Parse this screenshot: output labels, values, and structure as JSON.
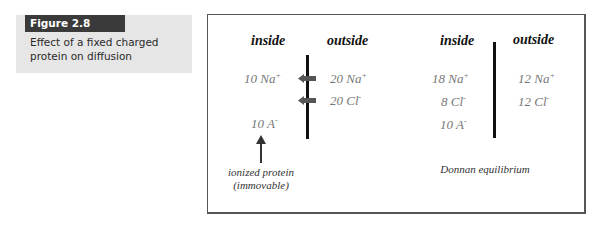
{
  "caption": {
    "label": "Figure 2.8",
    "text": "Effect of a fixed charged protein on diffusion"
  },
  "left_panel": {
    "inside_header": "inside",
    "outside_header": "outside",
    "inside_ions": [
      {
        "count": "10",
        "ion": "Na",
        "charge": "+"
      },
      {
        "count": "10",
        "ion": "A",
        "charge": "-"
      }
    ],
    "outside_ions": [
      {
        "count": "20",
        "ion": "Na",
        "charge": "+"
      },
      {
        "count": "20",
        "ion": "Cl",
        "charge": "-"
      }
    ],
    "annotation_line1": "ionized protein",
    "annotation_line2": "(immovable)"
  },
  "right_panel": {
    "inside_header": "inside",
    "outside_header": "outside",
    "inside_ions": [
      {
        "count": "18",
        "ion": "Na",
        "charge": "+"
      },
      {
        "count": "8",
        "ion": "Cl",
        "charge": "-"
      },
      {
        "count": "10",
        "ion": "A",
        "charge": "-"
      }
    ],
    "outside_ions": [
      {
        "count": "12",
        "ion": "Na",
        "charge": "+"
      },
      {
        "count": "12",
        "ion": "Cl",
        "charge": "-"
      }
    ],
    "label": "Donnan equilibrium"
  },
  "colors": {
    "caption_label_bg": "#3a3a3a",
    "caption_bg": "#e6e6e6",
    "ion_text": "#777777",
    "arrow": "#555555"
  }
}
